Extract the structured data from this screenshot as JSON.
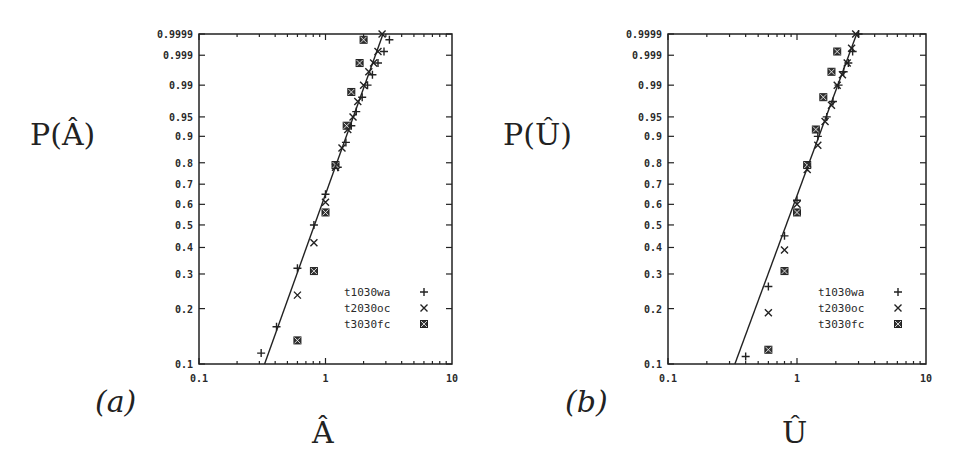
{
  "figure": {
    "panels": [
      {
        "id": "a",
        "panel_label": "(a)",
        "ylabel": "P(Â)",
        "xlabel": "Â"
      },
      {
        "id": "b",
        "panel_label": "(b)",
        "ylabel": "P(Û)",
        "xlabel": "Û"
      }
    ]
  },
  "chart_data": [
    {
      "type": "scatter",
      "title": "",
      "panel_label": "(a)",
      "xlabel": "Â",
      "ylabel": "P(Â)",
      "xscale": "log",
      "yscale": "weibull-probability",
      "xlim": [
        0.1,
        10
      ],
      "ylim": [
        0.1,
        0.9999
      ],
      "x_ticks": [
        "0.1",
        "1",
        "10"
      ],
      "y_ticks": [
        "0.1",
        "0.2",
        "0.3",
        "0.4",
        "0.5",
        "0.6",
        "0.7",
        "0.8",
        "0.9",
        "0.95",
        "0.99",
        "0.999",
        "0.9999"
      ],
      "grid": false,
      "legend_position": "lower right",
      "series": [
        {
          "name": "t1030wa",
          "marker": "+",
          "x": [
            0.31,
            0.41,
            0.6,
            0.81,
            1.0,
            1.25,
            1.45,
            1.6,
            1.75,
            1.95,
            2.15,
            2.35,
            2.6,
            2.9,
            3.2
          ],
          "y": [
            0.115,
            0.16,
            0.32,
            0.5,
            0.65,
            0.78,
            0.88,
            0.93,
            0.96,
            0.98,
            0.99,
            0.995,
            0.998,
            0.9993,
            0.9998
          ]
        },
        {
          "name": "t2030oc",
          "marker": "x",
          "x": [
            0.6,
            0.81,
            1.0,
            1.2,
            1.35,
            1.5,
            1.65,
            1.8,
            2.0,
            2.2,
            2.4,
            2.6,
            2.8
          ],
          "y": [
            0.235,
            0.42,
            0.61,
            0.78,
            0.86,
            0.92,
            0.95,
            0.975,
            0.99,
            0.996,
            0.998,
            0.9993,
            0.9999
          ]
        },
        {
          "name": "t3030fc",
          "marker": "box",
          "x": [
            0.6,
            0.81,
            1.0,
            1.2,
            1.47,
            1.6,
            1.86,
            2.0
          ],
          "y": [
            0.135,
            0.31,
            0.56,
            0.79,
            0.93,
            0.985,
            0.998,
            0.9998
          ]
        },
        {
          "name": "fit",
          "marker": "line",
          "x": [
            0.33,
            2.85
          ],
          "y": [
            0.1,
            0.9999
          ]
        }
      ]
    },
    {
      "type": "scatter",
      "title": "",
      "panel_label": "(b)",
      "xlabel": "Û",
      "ylabel": "P(Û)",
      "xscale": "log",
      "yscale": "weibull-probability",
      "xlim": [
        0.1,
        10
      ],
      "ylim": [
        0.1,
        0.9999
      ],
      "x_ticks": [
        "0.1",
        "1",
        "10"
      ],
      "y_ticks": [
        "0.1",
        "0.2",
        "0.3",
        "0.4",
        "0.5",
        "0.6",
        "0.7",
        "0.8",
        "0.9",
        "0.95",
        "0.99",
        "0.999",
        "0.9999"
      ],
      "grid": false,
      "legend_position": "lower right",
      "series": [
        {
          "name": "t1030wa",
          "marker": "+",
          "x": [
            0.4,
            0.6,
            0.8,
            1.0,
            1.2,
            1.45,
            1.7,
            1.9,
            2.1,
            2.3,
            2.5,
            2.7,
            3.0
          ],
          "y": [
            0.11,
            0.26,
            0.45,
            0.62,
            0.78,
            0.9,
            0.95,
            0.975,
            0.99,
            0.996,
            0.998,
            0.9993,
            0.9999
          ]
        },
        {
          "name": "t2030oc",
          "marker": "x",
          "x": [
            0.6,
            0.8,
            1.0,
            1.2,
            1.45,
            1.65,
            1.85,
            2.05,
            2.25,
            2.45,
            2.65,
            2.85
          ],
          "y": [
            0.19,
            0.39,
            0.6,
            0.77,
            0.87,
            0.94,
            0.97,
            0.99,
            0.995,
            0.998,
            0.9995,
            0.9999
          ]
        },
        {
          "name": "t3030fc",
          "marker": "box",
          "x": [
            0.6,
            0.8,
            1.0,
            1.2,
            1.4,
            1.6,
            1.85,
            2.05
          ],
          "y": [
            0.12,
            0.31,
            0.56,
            0.79,
            0.92,
            0.98,
            0.996,
            0.9993
          ]
        },
        {
          "name": "fit",
          "marker": "line",
          "x": [
            0.33,
            2.9
          ],
          "y": [
            0.1,
            0.9999
          ]
        }
      ]
    }
  ],
  "legend": {
    "entries": [
      {
        "label": "t1030wa",
        "marker": "+"
      },
      {
        "label": "t2030oc",
        "marker": "x"
      },
      {
        "label": "t3030fc",
        "marker": "box"
      }
    ]
  }
}
